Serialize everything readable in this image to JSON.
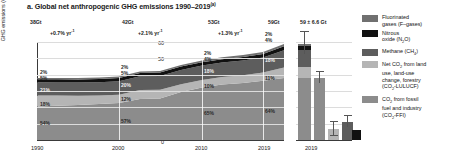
{
  "title": {
    "text": "a. Global net anthropogenic GHG emissions 1990–2019",
    "superscript": "(a)"
  },
  "chart_data": {
    "type": "area",
    "title": "Global net anthropogenic GHG emissions 1990–2019",
    "xlabel": "",
    "ylabel": "GHG emissions (GtCO₂-eq yr⁻¹)",
    "ylim": [
      0,
      60
    ],
    "yticks": [
      "0",
      "10",
      "20",
      "30",
      "40",
      "50",
      "60"
    ],
    "xticks": [
      "1990",
      "2000",
      "2010",
      "2019"
    ],
    "x": [
      1990,
      2000,
      2010,
      2019
    ],
    "grid": true,
    "legend_position": "right",
    "totals_gt": [
      "38Gt",
      "42Gt",
      "53Gt",
      "59Gt"
    ],
    "growth_rates": [
      "+0.7% yr⁻¹",
      "+2.1% yr⁻¹",
      "+1.3% yr⁻¹"
    ],
    "series": [
      {
        "name": "CO₂ from fossil fuel and industry (CO₂-FFI)",
        "color": "#8c8c8c",
        "values": [
          20.5,
          24.0,
          34.5,
          38.0
        ],
        "share_labels": [
          "54%",
          "57%",
          "65%",
          "64%"
        ]
      },
      {
        "name": "Net CO₂ from land use, land-use change, forestry (CO₂-LULUCF)",
        "color": "#b5b5b5",
        "values": [
          6.8,
          5.5,
          5.3,
          6.5
        ],
        "share_labels": [
          "18%",
          "12%",
          "10%",
          "11%"
        ]
      },
      {
        "name": "Methane (CH₄)",
        "color": "#5d5d5d",
        "values": [
          8.0,
          8.4,
          9.5,
          10.6
        ],
        "share_labels": [
          "21%",
          "20%",
          "18%",
          "18%"
        ]
      },
      {
        "name": "Nitrous oxide (N₂O)",
        "color": "#111111",
        "values": [
          1.9,
          2.1,
          2.1,
          2.4
        ],
        "share_labels": [
          "5%",
          "5%",
          "4%",
          "4%"
        ]
      },
      {
        "name": "Fluorinated gases (F-gases)",
        "color": "#707070",
        "values": [
          0.8,
          0.9,
          1.1,
          1.4
        ],
        "share_labels": [
          "2%",
          "2%",
          "2%",
          "2%"
        ]
      }
    ],
    "side_panel": {
      "type": "bar",
      "xticks": [
        "2019"
      ],
      "total_label": "59 ± 6.6 Gt",
      "bars": [
        {
          "name": "total",
          "value": 59,
          "error": 6.6
        },
        {
          "name": "co2-ffi",
          "value": 38,
          "error": 3.0
        },
        {
          "name": "co2-lulucf",
          "value": 6.5,
          "error": 4.0
        },
        {
          "name": "ch4",
          "value": 11,
          "error": 3.0
        }
      ]
    }
  },
  "legend": {
    "items": [
      {
        "label": "Fluorinated gases (F-gases)",
        "color": "#707070"
      },
      {
        "label": "Nitrous oxide (N₂O)",
        "color": "#111111"
      },
      {
        "label": "Methane (CH₄)",
        "color": "#5d5d5d"
      },
      {
        "label": "Net CO₂ from land use, land-use change, forestry (CO₂-LULUCF)",
        "color": "#b5b5b5"
      },
      {
        "label": "CO₂ from fossil fuel and industry (CO₂-FFI)",
        "color": "#8c8c8c"
      }
    ]
  }
}
